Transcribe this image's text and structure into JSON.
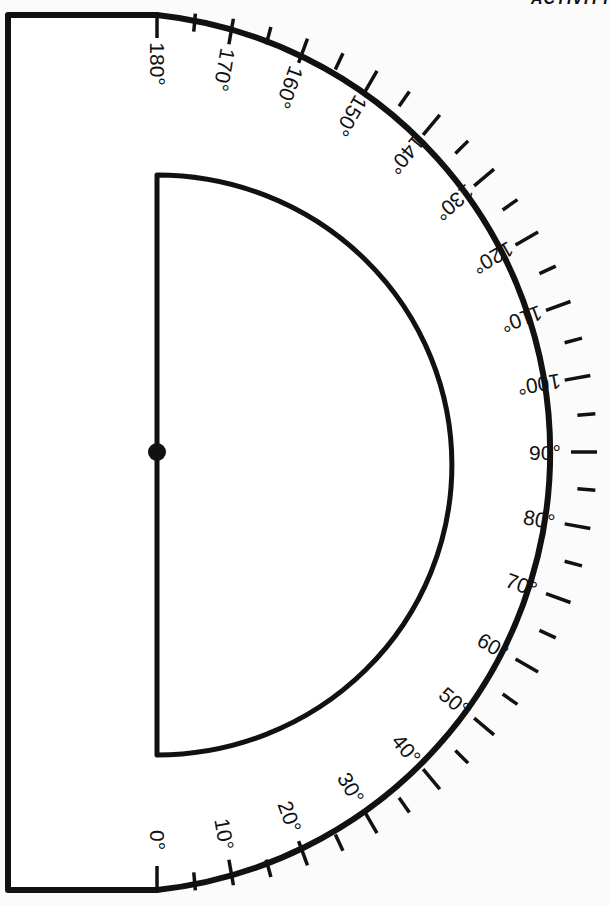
{
  "diagram": {
    "type": "protractor",
    "corner_text": "ACTIVITY",
    "colors": {
      "ink": "#111111",
      "paper": "#fbfbfb"
    },
    "outer": {
      "left_x": 8,
      "top_y": 15,
      "bottom_y": 890,
      "center_x": 157,
      "center_y": 452,
      "radius": 440
    },
    "inner": {
      "x": 157,
      "top_y": 175,
      "bottom_y": 755,
      "center_y": 465,
      "radius": 295
    },
    "center_dot": {
      "x": 157,
      "y": 452,
      "r": 9
    },
    "ticks": {
      "minor_step_deg": 5,
      "major_step_deg": 10,
      "major_len": 26,
      "minor_len": 18
    },
    "labels": [
      {
        "deg": 0,
        "text": "0°"
      },
      {
        "deg": 10,
        "text": "10°"
      },
      {
        "deg": 20,
        "text": "20°"
      },
      {
        "deg": 30,
        "text": "30°"
      },
      {
        "deg": 40,
        "text": "40°"
      },
      {
        "deg": 50,
        "text": "50°"
      },
      {
        "deg": 60,
        "text": "60°"
      },
      {
        "deg": 70,
        "text": "70°"
      },
      {
        "deg": 80,
        "text": "80°"
      },
      {
        "deg": 90,
        "text": "90°"
      },
      {
        "deg": 100,
        "text": "100°"
      },
      {
        "deg": 110,
        "text": "110°"
      },
      {
        "deg": 120,
        "text": "120°"
      },
      {
        "deg": 130,
        "text": "130°"
      },
      {
        "deg": 140,
        "text": "140°"
      },
      {
        "deg": 150,
        "text": "150°"
      },
      {
        "deg": 160,
        "text": "160°"
      },
      {
        "deg": 170,
        "text": "170°"
      },
      {
        "deg": 180,
        "text": "180°"
      }
    ]
  }
}
